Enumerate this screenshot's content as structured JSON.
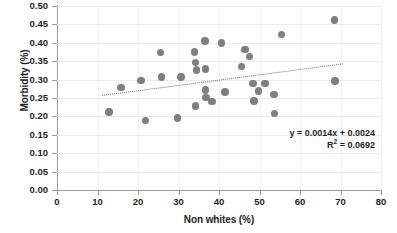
{
  "chart_data": {
    "type": "scatter",
    "title": "",
    "xlabel": "Non whites (%)",
    "ylabel": "Morbidity (%)",
    "xlim": [
      0,
      80
    ],
    "ylim": [
      0.0,
      0.5
    ],
    "xticks": [
      "0",
      "10",
      "20",
      "30",
      "40",
      "50",
      "60",
      "70",
      "80"
    ],
    "xtick_values": [
      0,
      10,
      20,
      30,
      40,
      50,
      60,
      70,
      80
    ],
    "yticks": [
      "0.00",
      "0.05",
      "0.10",
      "0.15",
      "0.20",
      "0.25",
      "0.30",
      "0.35",
      "0.40",
      "0.45",
      "0.50"
    ],
    "ytick_values": [
      0.0,
      0.05,
      0.1,
      0.15,
      0.2,
      0.25,
      0.3,
      0.35,
      0.4,
      0.45,
      0.5
    ],
    "grid": true,
    "legend": "none",
    "marker_color": "#7f7f7f",
    "trendline_color": "#6f6f6f",
    "points": [
      {
        "x": 12.8,
        "y": 0.212
      },
      {
        "x": 15.8,
        "y": 0.279
      },
      {
        "x": 20.7,
        "y": 0.298
      },
      {
        "x": 21.8,
        "y": 0.189
      },
      {
        "x": 25.5,
        "y": 0.374
      },
      {
        "x": 25.8,
        "y": 0.307
      },
      {
        "x": 29.8,
        "y": 0.196
      },
      {
        "x": 30.6,
        "y": 0.307
      },
      {
        "x": 33.9,
        "y": 0.375
      },
      {
        "x": 34.2,
        "y": 0.347
      },
      {
        "x": 34.4,
        "y": 0.326
      },
      {
        "x": 34.2,
        "y": 0.228
      },
      {
        "x": 36.5,
        "y": 0.405
      },
      {
        "x": 36.6,
        "y": 0.329
      },
      {
        "x": 36.6,
        "y": 0.272
      },
      {
        "x": 36.8,
        "y": 0.252
      },
      {
        "x": 38.3,
        "y": 0.24
      },
      {
        "x": 40.6,
        "y": 0.399
      },
      {
        "x": 41.5,
        "y": 0.266
      },
      {
        "x": 45.6,
        "y": 0.336
      },
      {
        "x": 46.4,
        "y": 0.381
      },
      {
        "x": 47.6,
        "y": 0.363
      },
      {
        "x": 48.4,
        "y": 0.29
      },
      {
        "x": 48.6,
        "y": 0.242
      },
      {
        "x": 49.7,
        "y": 0.269
      },
      {
        "x": 51.4,
        "y": 0.289
      },
      {
        "x": 53.6,
        "y": 0.259
      },
      {
        "x": 53.7,
        "y": 0.208
      },
      {
        "x": 55.4,
        "y": 0.422
      },
      {
        "x": 68.5,
        "y": 0.462
      },
      {
        "x": 68.6,
        "y": 0.296
      }
    ],
    "trendline": {
      "equation_label": "y = 0.0014x + 0.0024",
      "r2_label": "R",
      "r2_superscript": "2",
      "r2_value_label": " = 0.0692",
      "slope": 0.0014,
      "intercept": 0.0024,
      "r_squared": 0.0692,
      "x_start": 11.0,
      "x_end": 70.5,
      "y_start": 0.259,
      "y_end": 0.345
    }
  },
  "annotation": {
    "line1": "y = 0.0014x + 0.0024",
    "line2_prefix": "R",
    "line2_sup": "2",
    "line2_suffix": " = 0.0692"
  },
  "caption": {
    "partial_text": ""
  }
}
